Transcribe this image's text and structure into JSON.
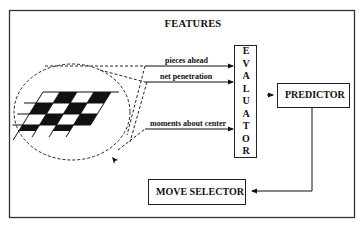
{
  "diagram": {
    "title": "FEATURES",
    "features": [
      {
        "label": "pieces ahead"
      },
      {
        "label": "net penetration"
      },
      {
        "label": "moments about center"
      }
    ],
    "boxes": {
      "evaluator": {
        "label": "EVALUATOR",
        "letters": [
          "E",
          "V",
          "A",
          "L",
          "U",
          "A",
          "T",
          "O",
          "R"
        ]
      },
      "predictor": {
        "label": "PREDICTOR"
      },
      "move_selector": {
        "label": "MOVE SELECTOR"
      }
    },
    "connections": [
      {
        "from": "pieces ahead",
        "to": "EVALUATOR"
      },
      {
        "from": "net penetration",
        "to": "EVALUATOR"
      },
      {
        "from": "moments about center",
        "to": "EVALUATOR"
      },
      {
        "from": "EVALUATOR",
        "to": "PREDICTOR"
      },
      {
        "from": "PREDICTOR",
        "to": "MOVE SELECTOR"
      }
    ],
    "colors": {
      "ink": "#111111",
      "background": "#ffffff"
    }
  }
}
